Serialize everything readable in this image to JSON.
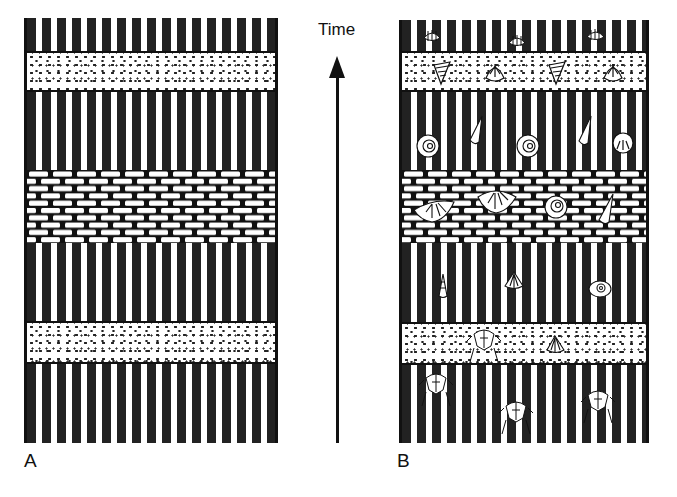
{
  "figure": {
    "time_label": "Time",
    "column_a_label": "A",
    "column_b_label": "B",
    "arrow_direction": "up"
  },
  "columns": {
    "A": {
      "x": 24,
      "y": 18,
      "width": 254,
      "height": 425,
      "description": "Stratigraphic column without fossils",
      "layers_top_to_bottom": [
        {
          "lithology": "shale",
          "top": 18,
          "bottom": 52
        },
        {
          "lithology": "sandstone",
          "top": 52,
          "bottom": 91
        },
        {
          "lithology": "shale",
          "top": 91,
          "bottom": 170
        },
        {
          "lithology": "limestone",
          "top": 170,
          "bottom": 243
        },
        {
          "lithology": "shale",
          "top": 243,
          "bottom": 322
        },
        {
          "lithology": "sandstone",
          "top": 322,
          "bottom": 363
        },
        {
          "lithology": "shale",
          "top": 363,
          "bottom": 443
        }
      ]
    },
    "B": {
      "x": 399,
      "y": 20,
      "width": 250,
      "height": 423,
      "description": "Same stratigraphic column with fossils",
      "layers_top_to_bottom": [
        {
          "lithology": "shale",
          "top": 20,
          "bottom": 52,
          "fossils": [
            "brachiopod",
            "brachiopod",
            "brachiopod"
          ]
        },
        {
          "lithology": "sandstone",
          "top": 52,
          "bottom": 91,
          "fossils": [
            "horn-coral",
            "bivalve",
            "horn-coral",
            "bivalve"
          ]
        },
        {
          "lithology": "shale",
          "top": 91,
          "bottom": 170,
          "fossils": [
            "ammonite",
            "gastropod",
            "ammonite",
            "gastropod",
            "sea-urchin"
          ]
        },
        {
          "lithology": "limestone",
          "top": 170,
          "bottom": 243,
          "fossils": [
            "spiriferid-brachiopod",
            "spiriferid-brachiopod",
            "ammonite",
            "gastropod"
          ]
        },
        {
          "lithology": "shale",
          "top": 243,
          "bottom": 322,
          "fossils": [
            "gastropod",
            "brachiopod",
            "coiled-gastropod"
          ]
        },
        {
          "lithology": "sandstone",
          "top": 322,
          "bottom": 363,
          "fossils": [
            "trilobite",
            "brachiopod"
          ]
        },
        {
          "lithology": "shale",
          "top": 363,
          "bottom": 443,
          "fossils": [
            "trilobite",
            "trilobite",
            "trilobite"
          ]
        }
      ]
    }
  }
}
